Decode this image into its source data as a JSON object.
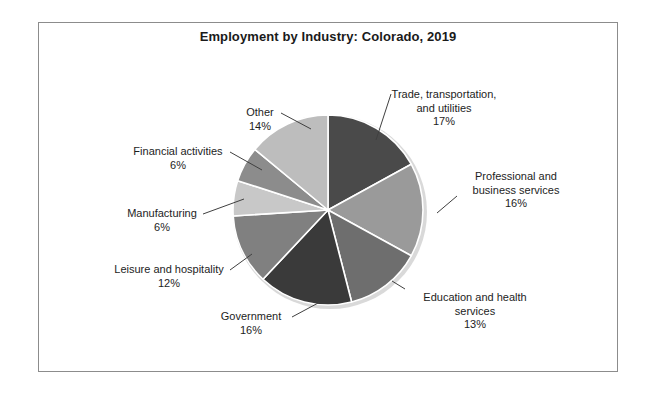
{
  "figure": {
    "title": "Employment by Industry: Colorado, 2019",
    "border_color": "#8c8c8c",
    "background": "#ffffff"
  },
  "chart_data": {
    "type": "pie",
    "title": "Employment by Industry: Colorado, 2019",
    "xlabel": "",
    "ylabel": "",
    "units": "percent",
    "start_angle_deg": 0,
    "direction": "clockwise",
    "labels": [
      "Trade, transportation, and utilities",
      "Professional and business services",
      "Education and health services",
      "Government",
      "Leisure and hospitality",
      "Manufacturing",
      "Financial activities",
      "Other"
    ],
    "values": [
      17,
      16,
      13,
      16,
      12,
      6,
      6,
      14
    ],
    "value_labels": [
      "17%",
      "16%",
      "13%",
      "16%",
      "12%",
      "6%",
      "6%",
      "14%"
    ],
    "colors": [
      "#4a4a4a",
      "#9a9a9a",
      "#6e6e6e",
      "#3a3a3a",
      "#808080",
      "#c8c8c8",
      "#8c8c8c",
      "#bdbdbd"
    ],
    "slice_edge_color": "#ffffff",
    "legend": "none",
    "grid": false
  },
  "labels": {
    "trade": {
      "line1": "Trade, transportation,",
      "line2": "and utilities",
      "pct": "17%"
    },
    "professional": {
      "line1": "Professional and",
      "line2": "business services",
      "pct": "16%"
    },
    "education": {
      "line1": "Education and health",
      "line2": "services",
      "pct": "13%"
    },
    "government": {
      "line1": "Government",
      "pct": "16%"
    },
    "leisure": {
      "line1": "Leisure and hospitality",
      "pct": "12%"
    },
    "manufacturing": {
      "line1": "Manufacturing",
      "pct": "6%"
    },
    "financial": {
      "line1": "Financial activities",
      "pct": "6%"
    },
    "other": {
      "line1": "Other",
      "pct": "14%"
    }
  }
}
